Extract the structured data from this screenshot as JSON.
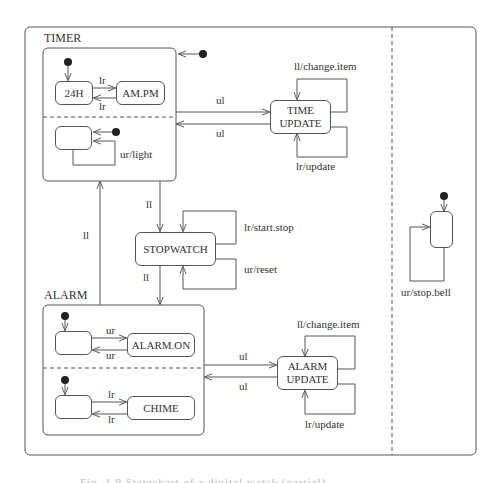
{
  "diagram": {
    "type": "statechart",
    "colors": {
      "line": "#555555",
      "text": "#333333",
      "background": "#ffffff"
    },
    "superstates": {
      "timer": {
        "label": "TIMER"
      },
      "alarm": {
        "label": "ALARM"
      }
    },
    "states": {
      "h24": "24H",
      "ampm": "AM.PM",
      "time_update": [
        "TIME",
        "UPDATE"
      ],
      "stopwatch": "STOPWATCH",
      "alarm_on": "ALARM.ON",
      "chime": "CHIME",
      "alarm_update": [
        "ALARM",
        "UPDATE"
      ]
    },
    "transitions": {
      "h24_to_ampm": "lr",
      "ampm_to_h24": "lr",
      "light_loop": "ur/light",
      "timer_to_time_update": "ul",
      "time_update_to_timer": "ul",
      "time_update_change_item": "ll/change.item",
      "time_update_update": "lr/update",
      "timer_to_stopwatch": "ll",
      "stopwatch_start_stop": "lr/start.stop",
      "stopwatch_reset": "ur/reset",
      "stopwatch_to_alarm": "ll",
      "alarm_to_timer": "ll",
      "idle_to_alarm_on": "ur",
      "alarm_on_to_idle": "ur",
      "idle_to_chime": "lr",
      "chime_to_idle": "lr",
      "alarm_to_alarm_update": "ul",
      "alarm_update_to_alarm": "ul",
      "alarm_update_change_item": "ll/change.item",
      "alarm_update_update": "lr/update",
      "bell_loop": "ur/stop.bell"
    },
    "caption": "Fig. 1.9 Statechart of a digital watch (partial)"
  }
}
